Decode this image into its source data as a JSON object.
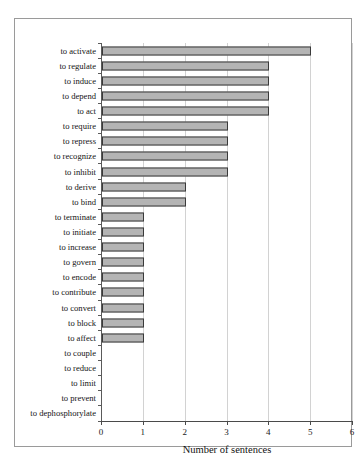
{
  "chart_data": {
    "type": "bar",
    "orientation": "horizontal",
    "title": "",
    "xlabel": "Number of sentences",
    "ylabel": "",
    "xlim": [
      0,
      6
    ],
    "xticks": [
      0,
      1,
      2,
      3,
      4,
      5,
      6
    ],
    "grid": true,
    "legend": false,
    "categories": [
      "to activate",
      "to regulate",
      "to induce",
      "to depend",
      "to act",
      "to require",
      "to repress",
      "to recognize",
      "to inhibit",
      "to derive",
      "to bind",
      "to terminate",
      "to initiate",
      "to increase",
      "to govern",
      "to encode",
      "to contribute",
      "to convert",
      "to block",
      "to affect",
      "to couple",
      "to reduce",
      "to limit",
      "to prevent",
      "to dephosphorylate"
    ],
    "values": [
      5,
      4,
      4,
      4,
      4,
      3,
      3,
      3,
      3,
      2,
      2,
      1,
      1,
      1,
      1,
      1,
      1,
      1,
      1,
      1,
      0,
      0,
      0,
      0,
      0
    ],
    "bar_color": "#b4b4b4",
    "bar_border_color": "#3a3a3a",
    "grid_color": "#d2d2d2",
    "axis_color": "#4a4a4a",
    "frame_color": "#9a9a9a"
  }
}
